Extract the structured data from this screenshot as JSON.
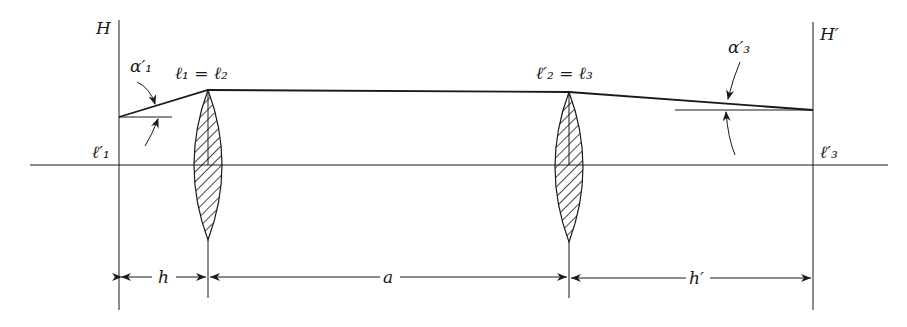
{
  "diagram": {
    "type": "optical-system-two-thin-lenses",
    "colors": {
      "ink": "#1a1a1a",
      "background": "#ffffff"
    },
    "principal_planes": [
      {
        "id": "H",
        "label": "H",
        "x": 119
      },
      {
        "id": "H-prime",
        "label": "H′",
        "x": 813
      }
    ],
    "lenses": [
      {
        "id": "lens-1",
        "x": 208,
        "top_label": "ℓ₁ = ℓ₂"
      },
      {
        "id": "lens-2",
        "x": 569,
        "top_label": "ℓ′₂ = ℓ₃"
      }
    ],
    "labels": {
      "H": "H",
      "H_prime": "H′",
      "lens1_top": "ℓ₁ = ℓ₂",
      "lens2_top": "ℓ′₂ = ℓ₃",
      "l1_prime": "ℓ′₁",
      "l3_prime": "ℓ′₃",
      "alpha1_prime": "α′₁",
      "alpha3_prime": "α′₃"
    },
    "dimensions": [
      {
        "id": "dim-h",
        "label": "h",
        "from": "H",
        "to": "lens-1"
      },
      {
        "id": "dim-a",
        "label": "a",
        "from": "lens-1",
        "to": "lens-2"
      },
      {
        "id": "dim-h-prime",
        "label": "h′",
        "from": "lens-2",
        "to": "H-prime"
      }
    ]
  }
}
